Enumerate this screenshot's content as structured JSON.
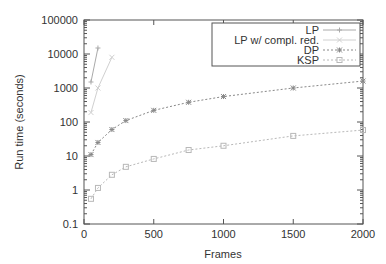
{
  "chart_data": {
    "type": "line",
    "title": "",
    "xlabel": "Frames",
    "ylabel": "Run time (seconds)",
    "xscale": "linear",
    "yscale": "log",
    "xlim": [
      0,
      2000
    ],
    "ylim": [
      0.1,
      100000
    ],
    "xticks": [
      0,
      500,
      1000,
      1500,
      2000
    ],
    "xtick_labels": [
      "0",
      "500",
      "1000",
      "1500",
      "2000"
    ],
    "yticks": [
      0.1,
      1,
      10,
      100,
      1000,
      10000,
      100000
    ],
    "ytick_labels": [
      "0.1",
      "1",
      "10",
      "100",
      "1000",
      "10000",
      "100000"
    ],
    "grid": false,
    "legend_position": "upper right (boxed)",
    "series": [
      {
        "name": "LP",
        "marker": "plus",
        "line": "solid",
        "color": "#aaaaaa",
        "x": [
          50,
          100
        ],
        "y": [
          1500,
          15000
        ]
      },
      {
        "name": "LP w/ compl. red.",
        "marker": "cross",
        "line": "solid",
        "color": "#d0d0d0",
        "x": [
          50,
          100,
          200
        ],
        "y": [
          190,
          1000,
          8000
        ]
      },
      {
        "name": "DP",
        "marker": "star",
        "line": "dotted",
        "color": "#888888",
        "x": [
          50,
          100,
          200,
          300,
          500,
          750,
          1000,
          1500,
          2000
        ],
        "y": [
          11,
          25,
          60,
          110,
          220,
          380,
          560,
          1000,
          1600
        ]
      },
      {
        "name": "KSP",
        "marker": "square",
        "line": "dotted",
        "color": "#b8b8b8",
        "x": [
          50,
          100,
          200,
          300,
          500,
          750,
          1000,
          1500,
          2000
        ],
        "y": [
          0.55,
          1.15,
          2.8,
          4.8,
          8.2,
          15,
          20,
          39,
          58
        ]
      }
    ]
  },
  "colors": {
    "axis": "#555555",
    "text": "#333333",
    "background": "#ffffff"
  }
}
